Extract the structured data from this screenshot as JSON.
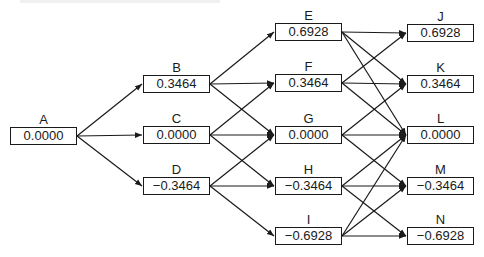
{
  "diagram": {
    "type": "binomial-tree",
    "node_size": {
      "width": 67,
      "height": 18
    },
    "colors": {
      "line": "#1a1a1a",
      "box_border": "#1a1a1a",
      "background": "#ffffff"
    },
    "nodes": [
      {
        "id": "A",
        "label": "A",
        "value": "0.0000",
        "x": 10,
        "y": 127
      },
      {
        "id": "B",
        "label": "B",
        "value": "0.3464",
        "x": 143,
        "y": 75
      },
      {
        "id": "C",
        "label": "C",
        "value": "0.0000",
        "x": 143,
        "y": 126
      },
      {
        "id": "D",
        "label": "D",
        "value": "−0.3464",
        "x": 143,
        "y": 177
      },
      {
        "id": "E",
        "label": "E",
        "value": "0.6928",
        "x": 275,
        "y": 23
      },
      {
        "id": "F",
        "label": "F",
        "value": "0.3464",
        "x": 275,
        "y": 74
      },
      {
        "id": "G",
        "label": "G",
        "value": "0.0000",
        "x": 275,
        "y": 126
      },
      {
        "id": "H",
        "label": "H",
        "value": "−0.3464",
        "x": 275,
        "y": 177
      },
      {
        "id": "I",
        "label": "I",
        "value": "−0.6928",
        "x": 275,
        "y": 227
      },
      {
        "id": "J",
        "label": "J",
        "value": "0.6928",
        "x": 407,
        "y": 24
      },
      {
        "id": "K",
        "label": "K",
        "value": "0.3464",
        "x": 407,
        "y": 75
      },
      {
        "id": "L",
        "label": "L",
        "value": "0.0000",
        "x": 407,
        "y": 126
      },
      {
        "id": "M",
        "label": "M",
        "value": "−0.3464",
        "x": 407,
        "y": 177
      },
      {
        "id": "N",
        "label": "N",
        "value": "−0.6928",
        "x": 407,
        "y": 227
      }
    ],
    "edges": [
      [
        "A",
        "B"
      ],
      [
        "A",
        "C"
      ],
      [
        "A",
        "D"
      ],
      [
        "B",
        "E"
      ],
      [
        "B",
        "F"
      ],
      [
        "B",
        "G"
      ],
      [
        "C",
        "F"
      ],
      [
        "C",
        "G"
      ],
      [
        "C",
        "H"
      ],
      [
        "D",
        "G"
      ],
      [
        "D",
        "H"
      ],
      [
        "D",
        "I"
      ],
      [
        "E",
        "J"
      ],
      [
        "E",
        "K"
      ],
      [
        "E",
        "L"
      ],
      [
        "F",
        "J"
      ],
      [
        "F",
        "K"
      ],
      [
        "F",
        "L"
      ],
      [
        "G",
        "K"
      ],
      [
        "G",
        "L"
      ],
      [
        "G",
        "M"
      ],
      [
        "H",
        "L"
      ],
      [
        "H",
        "M"
      ],
      [
        "H",
        "N"
      ],
      [
        "I",
        "L"
      ],
      [
        "I",
        "M"
      ],
      [
        "I",
        "N"
      ]
    ]
  }
}
